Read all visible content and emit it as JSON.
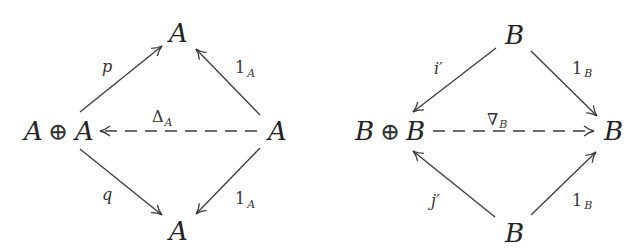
{
  "diagrams": [
    {
      "name": "diagonal-diagram",
      "nodes": {
        "top": "A",
        "left_a": "A",
        "left_op": "⊕",
        "left_b": "A",
        "right": "A",
        "bottom": "A"
      },
      "arrows": {
        "p": {
          "label": "p"
        },
        "top_identity": {
          "label": "1",
          "sub": "A"
        },
        "delta": {
          "label": "Δ",
          "sub": "A",
          "style": "dashed"
        },
        "q": {
          "label": "q"
        },
        "bottom_identity": {
          "label": "1",
          "sub": "A"
        }
      }
    },
    {
      "name": "codiagonal-diagram",
      "nodes": {
        "top": "B",
        "left_a": "B",
        "left_op": "⊕",
        "left_b": "B",
        "right": "B",
        "bottom": "B"
      },
      "arrows": {
        "i_prime": {
          "label": "i′"
        },
        "top_identity": {
          "label": "1",
          "sub": "B"
        },
        "nabla": {
          "label": "∇",
          "sub": "B",
          "style": "dashed"
        },
        "j_prime": {
          "label": "j′"
        },
        "bottom_identity": {
          "label": "1",
          "sub": "B"
        }
      }
    }
  ]
}
